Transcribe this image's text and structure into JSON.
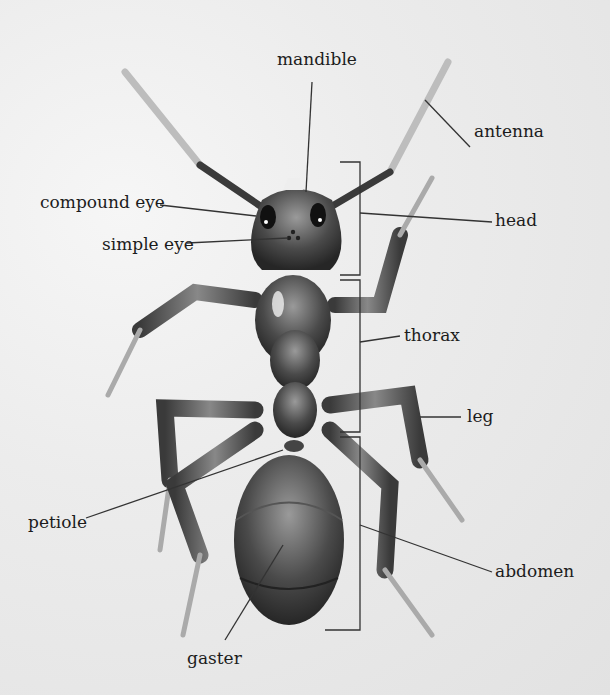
{
  "diagram": {
    "labels": {
      "mandible": "mandible",
      "antenna": "antenna",
      "compound_eye": "compound eye",
      "head": "head",
      "simple_eye": "simple eye",
      "thorax": "thorax",
      "leg": "leg",
      "petiole": "petiole",
      "abdomen": "abdomen",
      "gaster": "gaster"
    }
  }
}
